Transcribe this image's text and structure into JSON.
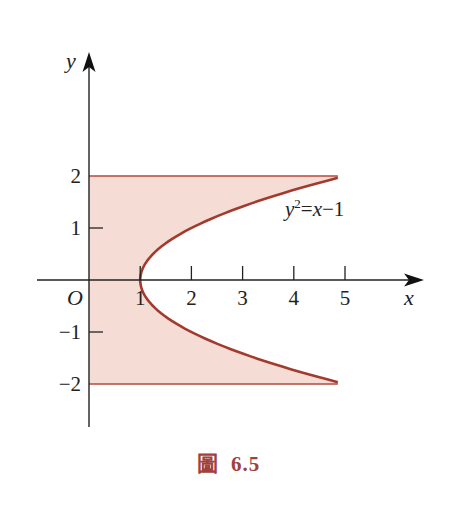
{
  "figure": {
    "caption_word": "圖",
    "caption_number": "6.5",
    "colors": {
      "fill": "#f5ddd6",
      "curve": "#a33a2e",
      "boundary": "#b5493c",
      "axis": "#222222",
      "caption": "#a0413a"
    }
  },
  "chart_data": {
    "type": "area",
    "title": "",
    "caption": "圖 6.5",
    "xlabel": "x",
    "ylabel": "y",
    "origin_label": "O",
    "xlim": [
      -1,
      6.5
    ],
    "ylim": [
      -2.8,
      4.4
    ],
    "x_ticks": [
      1,
      2,
      3,
      4,
      5
    ],
    "x_tick_labels": [
      "1",
      "2",
      "3",
      "4",
      "5"
    ],
    "y_ticks": [
      2,
      1,
      -1,
      -2
    ],
    "y_tick_labels": [
      "2",
      "1",
      "−1",
      "−2"
    ],
    "grid": false,
    "legend": null,
    "annotations": [
      {
        "text": "y²=x−1",
        "x": 4.0,
        "y": 1.25,
        "describes": "parabola"
      }
    ],
    "series": [
      {
        "name": "y²=x−1",
        "kind": "curve",
        "equation": "x = y^2 + 1",
        "y_range": [
          -2,
          2
        ],
        "points": [
          {
            "x": 5.0,
            "y": -2
          },
          {
            "x": 3.25,
            "y": -1.5
          },
          {
            "x": 2.0,
            "y": -1
          },
          {
            "x": 1.25,
            "y": -0.5
          },
          {
            "x": 1.0,
            "y": 0
          },
          {
            "x": 1.25,
            "y": 0.5
          },
          {
            "x": 2.0,
            "y": 1
          },
          {
            "x": 3.25,
            "y": 1.5
          },
          {
            "x": 5.0,
            "y": 2
          }
        ]
      },
      {
        "name": "y=2",
        "kind": "line",
        "points": [
          {
            "x": 0,
            "y": 2
          },
          {
            "x": 5,
            "y": 2
          }
        ]
      },
      {
        "name": "y=-2",
        "kind": "line",
        "points": [
          {
            "x": 0,
            "y": -2
          },
          {
            "x": 5,
            "y": -2
          }
        ]
      },
      {
        "name": "shaded region",
        "kind": "region",
        "description": "Region bounded by x=0, y=2, y=-2 and the parabola x=y²+1 (left of the parabola)",
        "bounds": {
          "x_left": 0,
          "x_right": "y^2+1",
          "y_bottom": -2,
          "y_top": 2
        }
      }
    ]
  }
}
